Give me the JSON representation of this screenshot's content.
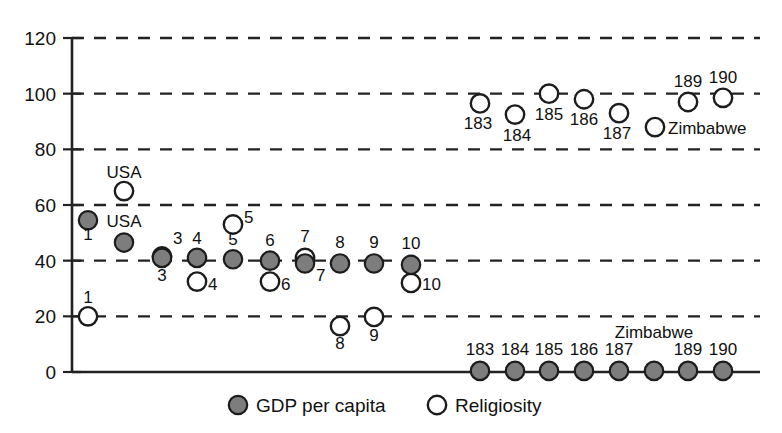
{
  "chart_data": {
    "type": "scatter",
    "title": "",
    "xlabel": "",
    "ylabel": "",
    "ylim": [
      0,
      120
    ],
    "yticks": [
      0,
      20,
      40,
      60,
      80,
      100,
      120
    ],
    "ytick_labels": [
      "0",
      "20",
      "40",
      "60",
      "80",
      "100",
      "120"
    ],
    "grid": "horizontal-dashed",
    "legend_position": "bottom-center",
    "xaxis_visible_ticks": false,
    "legend": [
      {
        "name": "GDP per capita",
        "marker": "filled-circle",
        "color": "#7d7d7d"
      },
      {
        "name": "Religiosity",
        "marker": "open-circle",
        "color": "#ffffff"
      }
    ],
    "series": [
      {
        "name": "GDP per capita",
        "marker": "filled-circle",
        "points": [
          {
            "label": "1",
            "x": 88,
            "y": 54.5
          },
          {
            "label": "USA",
            "x": 124,
            "y": 46.5
          },
          {
            "label": "3",
            "x": 162,
            "y": 41.0
          },
          {
            "label": "4",
            "x": 197,
            "y": 41.0
          },
          {
            "label": "5",
            "x": 233,
            "y": 40.5
          },
          {
            "label": "6",
            "x": 270,
            "y": 40.0
          },
          {
            "label": "7",
            "x": 305,
            "y": 39.0
          },
          {
            "label": "8",
            "x": 340,
            "y": 39.0
          },
          {
            "label": "9",
            "x": 374,
            "y": 39.0
          },
          {
            "label": "10",
            "x": 411,
            "y": 38.5
          },
          {
            "label": "183",
            "x": 480,
            "y": 0.4
          },
          {
            "label": "184",
            "x": 515,
            "y": 0.4
          },
          {
            "label": "185",
            "x": 549,
            "y": 0.4
          },
          {
            "label": "186",
            "x": 584,
            "y": 0.4
          },
          {
            "label": "187",
            "x": 619,
            "y": 0.4
          },
          {
            "label": "Zimbabwe",
            "x": 654,
            "y": 0.4
          },
          {
            "label": "189",
            "x": 688,
            "y": 0.4
          },
          {
            "label": "190",
            "x": 723,
            "y": 0.4
          }
        ]
      },
      {
        "name": "Religiosity",
        "marker": "open-circle",
        "points": [
          {
            "label": "1",
            "x": 88,
            "y": 20.0
          },
          {
            "label": "USA",
            "x": 124,
            "y": 65.0
          },
          {
            "label": "3",
            "x": 162,
            "y": 41.5
          },
          {
            "label": "4",
            "x": 197,
            "y": 32.5
          },
          {
            "label": "5",
            "x": 233,
            "y": 53.0
          },
          {
            "label": "6",
            "x": 270,
            "y": 32.5
          },
          {
            "label": "7",
            "x": 305,
            "y": 41.0
          },
          {
            "label": "8",
            "x": 340,
            "y": 16.5
          },
          {
            "label": "9",
            "x": 374,
            "y": 19.8
          },
          {
            "label": "10",
            "x": 411,
            "y": 32.0
          },
          {
            "label": "183",
            "x": 480,
            "y": 96.5
          },
          {
            "label": "184",
            "x": 515,
            "y": 92.5
          },
          {
            "label": "185",
            "x": 549,
            "y": 100.0
          },
          {
            "label": "186",
            "x": 584,
            "y": 98.0
          },
          {
            "label": "187",
            "x": 619,
            "y": 93.0
          },
          {
            "label": "Zimbabwe",
            "x": 655,
            "y": 88.0
          },
          {
            "label": "189",
            "x": 688,
            "y": 97.0
          },
          {
            "label": "190",
            "x": 723,
            "y": 98.5
          }
        ]
      }
    ],
    "annotations": [
      {
        "text": "1",
        "x": 88,
        "y": 220,
        "anchor": "middle",
        "dy": 20
      },
      {
        "text": "USA",
        "x": 124,
        "y": 243,
        "anchor": "middle",
        "dy": -16
      },
      {
        "text": "3",
        "x": 162,
        "y": 259,
        "anchor": "middle",
        "dy": 22
      },
      {
        "text": "4",
        "x": 197,
        "y": 259,
        "anchor": "middle",
        "dy": -15
      },
      {
        "text": "5",
        "x": 233,
        "y": 260,
        "anchor": "middle",
        "dy": -15
      },
      {
        "text": "6",
        "x": 270,
        "y": 261,
        "anchor": "middle",
        "dy": -15
      },
      {
        "text": "7",
        "x": 305,
        "y": 263,
        "anchor": "start",
        "dy": 18
      },
      {
        "text": "8",
        "x": 340,
        "y": 263,
        "anchor": "middle",
        "dy": -15
      },
      {
        "text": "9",
        "x": 374,
        "y": 263,
        "anchor": "middle",
        "dy": -15
      },
      {
        "text": "10",
        "x": 411,
        "y": 264,
        "anchor": "middle",
        "dy": -15
      },
      {
        "text": "1",
        "x": 88,
        "y": 318,
        "anchor": "middle",
        "dy": -15
      },
      {
        "text": "USA",
        "x": 124,
        "y": 193,
        "anchor": "middle",
        "dy": -15
      },
      {
        "text": "3",
        "x": 162,
        "y": 256,
        "anchor": "start",
        "dy": -12
      },
      {
        "text": "4",
        "x": 197,
        "y": 283,
        "anchor": "start",
        "dy": 7
      },
      {
        "text": "5",
        "x": 233,
        "y": 226,
        "anchor": "start",
        "dy": -3
      },
      {
        "text": "6",
        "x": 270,
        "y": 283,
        "anchor": "start",
        "dy": 7
      },
      {
        "text": "7",
        "x": 305,
        "y": 257,
        "anchor": "middle",
        "dy": -15
      },
      {
        "text": "8",
        "x": 340,
        "y": 327,
        "anchor": "middle",
        "dy": 22
      },
      {
        "text": "9",
        "x": 374,
        "y": 319,
        "anchor": "middle",
        "dy": 22
      },
      {
        "text": "10",
        "x": 411,
        "y": 283,
        "anchor": "start",
        "dy": 7
      }
    ],
    "cluster_labels_bottom": [
      "183",
      "184",
      "185",
      "186",
      "187",
      "Zimbabwe",
      "189",
      "190"
    ],
    "cluster_labels_top": [
      "183",
      "184",
      "185",
      "186",
      "187",
      "Zimbabwe",
      "189",
      "190"
    ]
  },
  "legend": {
    "gdp_label": "GDP per capita",
    "religiosity_label": "Religiosity"
  }
}
